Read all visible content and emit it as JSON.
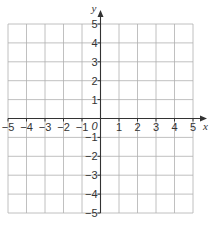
{
  "chart_data": {
    "type": "coordinate-grid",
    "title": "",
    "xlabel": "x",
    "ylabel": "y",
    "xlim": [
      -5,
      5
    ],
    "ylim": [
      -5,
      5
    ],
    "grid": true,
    "x_ticks": [
      -5,
      -4,
      -3,
      -2,
      -1,
      1,
      2,
      3,
      4,
      5
    ],
    "y_ticks": [
      5,
      4,
      3,
      2,
      1,
      -1,
      -2,
      -3,
      -4,
      -5
    ],
    "x_tick_labels": [
      "−5",
      "−4",
      "−3",
      "−2",
      "−1",
      "1",
      "2",
      "3",
      "4",
      "5"
    ],
    "y_tick_labels": [
      "5",
      "4",
      "3",
      "2",
      "1",
      "−1",
      "−2",
      "−3",
      "−4",
      "−5"
    ],
    "origin_label": "0",
    "series": []
  },
  "colors": {
    "grid": "#b0b0b0",
    "axis": "#333333",
    "background": "#ffffff"
  }
}
